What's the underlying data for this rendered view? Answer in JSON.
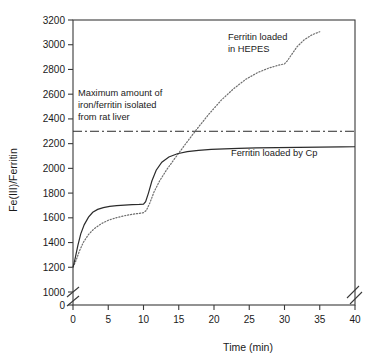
{
  "chart_data": {
    "type": "line",
    "title": "",
    "xlabel": "Time (min)",
    "ylabel": "Fe(III)/Ferritin",
    "xlim": [
      0,
      40
    ],
    "ylim": [
      1000,
      3200
    ],
    "y_axis_break": true,
    "y_break_labels": [
      "0",
      "1000"
    ],
    "x_axis_break": true,
    "grid": false,
    "legend_position": "inline-annotations",
    "xticks": [
      0,
      5,
      10,
      15,
      20,
      25,
      30,
      35,
      40
    ],
    "xtick_labels": [
      "0",
      "5",
      "10",
      "15",
      "20",
      "25",
      "30",
      "35",
      "40"
    ],
    "yticks": [
      0,
      1000,
      1200,
      1400,
      1600,
      1800,
      2000,
      2200,
      2400,
      2600,
      2800,
      3000,
      3200
    ],
    "ytick_labels": [
      "0",
      "1000",
      "1200",
      "1400",
      "1600",
      "1800",
      "2000",
      "2200",
      "2400",
      "2600",
      "2800",
      "3000",
      "3200"
    ],
    "series": [
      {
        "name": "Ferritin loaded by Cp",
        "style": "solid",
        "color": "#2b2b2b",
        "x": [
          0,
          0.3,
          0.7,
          1.1,
          1.6,
          2.2,
          2.8,
          3.5,
          4.3,
          5.2,
          6.2,
          7.3,
          8.4,
          9.4,
          10.0,
          10.3,
          10.7,
          11.2,
          11.8,
          12.6,
          13.6,
          14.8,
          16.2,
          17.8,
          19.6,
          21.5,
          23.5,
          26.0,
          29.0,
          32.0,
          35.0,
          38.0,
          40.0
        ],
        "y": [
          1200,
          1270,
          1380,
          1470,
          1545,
          1605,
          1645,
          1668,
          1683,
          1693,
          1699,
          1703,
          1706,
          1708,
          1710,
          1730,
          1800,
          1900,
          1985,
          2050,
          2092,
          2118,
          2135,
          2146,
          2153,
          2158,
          2162,
          2165,
          2168,
          2170,
          2172,
          2174,
          2175
        ]
      },
      {
        "name": "Ferritin loaded in HEPES",
        "style": "dotted",
        "color": "#6e6e6e",
        "x": [
          0,
          0.4,
          0.9,
          1.5,
          2.2,
          3.0,
          4.0,
          5.0,
          6.2,
          7.4,
          8.6,
          9.6,
          10.0,
          10.4,
          10.9,
          11.5,
          12.3,
          13.3,
          14.5,
          16.0,
          17.6,
          19.3,
          21.0,
          22.8,
          24.5,
          26.2,
          27.8,
          29.2,
          30.0,
          30.4,
          31.0,
          31.8,
          32.8,
          33.9,
          35.0
        ],
        "y": [
          1200,
          1250,
          1330,
          1405,
          1465,
          1512,
          1552,
          1580,
          1602,
          1618,
          1630,
          1638,
          1642,
          1660,
          1720,
          1810,
          1900,
          1990,
          2085,
          2200,
          2320,
          2440,
          2550,
          2645,
          2720,
          2775,
          2812,
          2835,
          2845,
          2870,
          2920,
          2985,
          3040,
          3080,
          3105
        ]
      }
    ],
    "reference_line": {
      "label": "Maximum amount of iron/ferritin isolated from rat liver",
      "value": 2300,
      "style": "dash-dot",
      "color": "#2b2b2b"
    },
    "annotations": [
      {
        "text_line1": "Maximum amount of",
        "text_line2": "iron/ferritin isolated",
        "text_line3": "from rat liver"
      },
      {
        "text_line1": "Ferritin loaded",
        "text_line2": "in HEPES"
      },
      {
        "text_line1": "Ferritin loaded by Cp"
      }
    ]
  },
  "annot_max": {
    "l1": "Maximum amount of",
    "l2": "iron/ferritin isolated",
    "l3": "from rat liver"
  },
  "annot_hepes": {
    "l1": "Ferritin loaded",
    "l2": "in HEPES"
  },
  "annot_cp": {
    "l1": "Ferritin loaded by Cp"
  },
  "axes": {
    "x_title": "Time (min)",
    "y_title": "Fe(III)/Ferritin"
  }
}
